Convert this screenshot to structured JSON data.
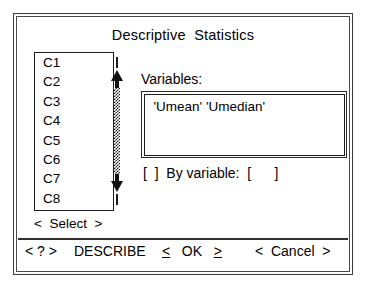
{
  "window": {
    "title": "Descriptive  Statistics"
  },
  "columns_list": {
    "name": "columns-listbox",
    "items": [
      "C1",
      "C2",
      "C3",
      "C4",
      "C5",
      "C6",
      "C7",
      "C8"
    ]
  },
  "scrollbar": {
    "up_arrow": "scroll-up-arrow",
    "down_arrow": "scroll-down-arrow"
  },
  "select_button": {
    "left_angle": "<",
    "label": "Select",
    "right_angle": ">"
  },
  "variables": {
    "label": "Variables:",
    "value": "'Umean' 'Umedian'"
  },
  "by_variable": {
    "checkbox": "[  ]",
    "label": "By variable:",
    "field": "[      ]"
  },
  "button_bar": {
    "help": "< ? >",
    "describe": "DESCRIBE",
    "ok_left_angle": "<",
    "ok_label": "OK",
    "ok_right_angle": ">",
    "cancel_left_angle": "<",
    "cancel_label": "Cancel",
    "cancel_right_angle": ">"
  },
  "colors": {
    "background": "#ffffff",
    "foreground": "#000000",
    "border": "#1c1c1c"
  }
}
